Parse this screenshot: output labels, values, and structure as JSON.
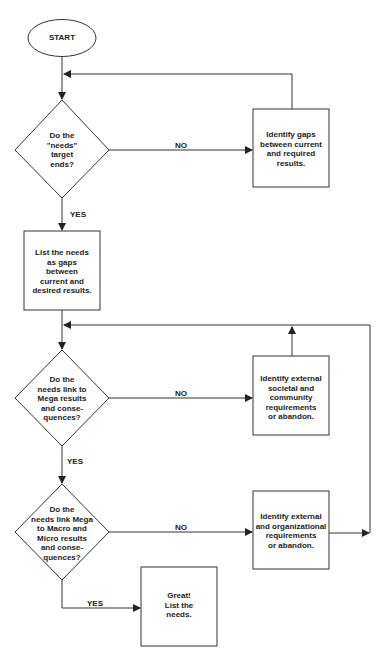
{
  "flowchart": {
    "start": {
      "label": "START"
    },
    "decisions": [
      {
        "id": "d1",
        "label": "Do the\n\"needs\"\ntarget\nends?"
      },
      {
        "id": "d2",
        "label": "Do the\nneeds link to\nMega results\nand conse-\nquences?"
      },
      {
        "id": "d3",
        "label": "Do the\nneeds link Mega\nto Macro and\nMicro results\nand conse-\nquences?"
      }
    ],
    "processes": [
      {
        "id": "p1",
        "label": "Identify gaps\nbetween current\nand required\nresults."
      },
      {
        "id": "p2",
        "label": "List the needs\nas gaps\nbetween\ncurrent and\ndesired results."
      },
      {
        "id": "p3",
        "label": "Identify external\nsocietal and\ncommunity\nrequirements\nor abandon."
      },
      {
        "id": "p4",
        "label": "Identify external\nand organizational\nrequirements\nor abandon."
      },
      {
        "id": "p5",
        "label": "Great!\nList the\nneeds."
      }
    ],
    "edges": {
      "d1_no": "NO",
      "d1_yes": "YES",
      "d2_no": "NO",
      "d2_yes": "YES",
      "d3_no": "NO",
      "d3_yes": "YES"
    },
    "colors": {
      "stroke": "#333333",
      "background": "#ffffff",
      "text": "#222222"
    }
  }
}
